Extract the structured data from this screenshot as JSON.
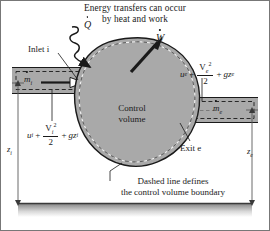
{
  "figure": {
    "title_line1": "Energy transfers can occur",
    "title_line2": "by heat and work",
    "caption_line1": "Dashed line defines",
    "caption_line2": "the control volume boundary",
    "control_volume_line1": "Control",
    "control_volume_line2": "volume",
    "inlet_label": "Inlet i",
    "exit_label": "Exit e",
    "heat_symbol": "Q",
    "work_symbol": "W",
    "mass_flow_in": "m",
    "mass_flow_in_sub": "i",
    "mass_flow_out": "m",
    "mass_flow_out_sub": "e",
    "height_in": "z",
    "height_in_sub": "i",
    "height_out": "z",
    "height_out_sub": "e",
    "inlet_energy": {
      "internal": "u",
      "internal_sub": "i",
      "plus1": "+",
      "kinetic_num": "V",
      "kinetic_num_sub": "i",
      "kinetic_num_sup": "2",
      "kinetic_den": "2",
      "plus2": "+",
      "potential": "gz",
      "potential_sub": "i"
    },
    "exit_energy": {
      "internal": "u",
      "internal_sub": "e",
      "plus1": "+",
      "kinetic_num": "V",
      "kinetic_num_sub": "e",
      "kinetic_num_sup": "2",
      "kinetic_den": "2",
      "plus2": "+",
      "potential": "gz",
      "potential_sub": "e"
    }
  },
  "colors": {
    "blob_fill": "#a9a9a9",
    "pipe_fill": "#a9a9a9",
    "stroke": "#1a1a1a",
    "ground_top": "#8f8f8f",
    "background": "#ffffff",
    "frame": "#6b6b6b"
  }
}
